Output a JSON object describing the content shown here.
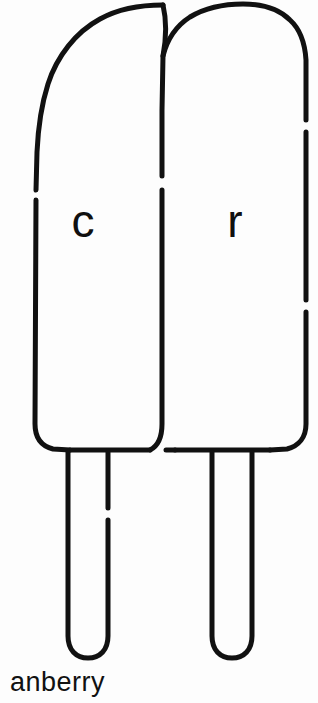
{
  "image": {
    "title": "Two popsicles line drawing",
    "background_color": "#fdfdfd",
    "ink_color": "#111111",
    "width": 318,
    "height": 703
  },
  "caption": {
    "text": "anberry",
    "note_truncated": "cropped at bottom edge"
  },
  "popsicles": [
    {
      "id": "left",
      "label": "c",
      "label_x": 83,
      "label_y": 225
    },
    {
      "id": "right",
      "label": "r",
      "label_x": 235,
      "label_y": 225
    }
  ]
}
